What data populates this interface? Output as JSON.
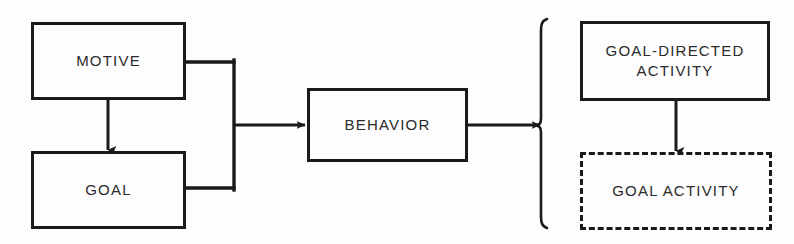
{
  "diagram": {
    "background_color": "#fdfdfd",
    "line_color": "#1a1a1a",
    "text_color": "#2b2b2b",
    "nodes": [
      {
        "id": "motive",
        "label": "MOTIVE",
        "style": "solid",
        "x": 31,
        "y": 22,
        "width": 155,
        "height": 78
      },
      {
        "id": "goal",
        "label": "GOAL",
        "style": "solid",
        "x": 31,
        "y": 151,
        "width": 155,
        "height": 78
      },
      {
        "id": "behavior",
        "label": "BEHAVIOR",
        "style": "solid",
        "x": 307,
        "y": 88,
        "width": 161,
        "height": 74
      },
      {
        "id": "goal-directed-activity",
        "label": "GOAL-DIRECTED\nACTIVITY",
        "style": "solid",
        "x": 580,
        "y": 21,
        "width": 190,
        "height": 80
      },
      {
        "id": "goal-activity",
        "label": "GOAL ACTIVITY",
        "style": "dashed",
        "x": 580,
        "y": 152,
        "width": 192,
        "height": 78
      }
    ],
    "connectors": [
      {
        "id": "motive-to-goal",
        "from": "motive",
        "to": "goal",
        "kind": "arrow-down"
      },
      {
        "id": "motive-goal-to-behavior",
        "from": "motive-and-goal",
        "to": "behavior",
        "kind": "merge-arrow-right"
      },
      {
        "id": "behavior-to-bracket",
        "from": "behavior",
        "to": "bracket",
        "kind": "arrow-right"
      },
      {
        "id": "goal-directed-to-goal-activity",
        "from": "goal-directed-activity",
        "to": "goal-activity",
        "kind": "arrow-down"
      }
    ],
    "bracket": {
      "id": "behavior-components-bracket",
      "glyph": "{",
      "x": 542,
      "y_top": 18,
      "y_bottom": 228
    }
  }
}
